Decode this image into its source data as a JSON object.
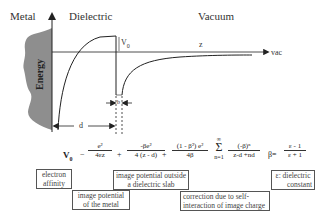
{
  "regions": {
    "metal": "Metal",
    "dielectric": "Dielectric",
    "vacuum": "Vacuum"
  },
  "axis": {
    "energy_label": "Energy",
    "z_label": "z",
    "vac_label": "vac",
    "v0_label": "V",
    "v0_sub": "0",
    "d_label": "d",
    "b_label": "b"
  },
  "formula": {
    "v0": "V",
    "v0_sub": "0",
    "minus": "−",
    "plus1": "+",
    "plus2": "+",
    "term1_num": "e²",
    "term1_den": "4εz",
    "term2_num": "-βe²",
    "term2_den": "4 (z - d)",
    "term3_num": "(1 - β²) e²",
    "term3_den": "4β",
    "sum_top": "∞",
    "sum_symbol": "Σ",
    "sum_bottom": "n=1",
    "term4_num": "(-β)ⁿ",
    "term4_den": "z-d +nd",
    "beta_lhs": "β=",
    "beta_num": "ε - 1",
    "beta_den": "ε + 1"
  },
  "annotations": {
    "electron_affinity": [
      "electron",
      "affinity"
    ],
    "image_metal": [
      "image potential",
      "of the metal"
    ],
    "image_slab": [
      "image potential outside",
      "a dielectric slab"
    ],
    "correction": [
      "correction due to self-",
      "interaction of image charge"
    ],
    "dielectric_const": [
      "ε: dielectric",
      "constant"
    ]
  },
  "colors": {
    "metal_fill": "#8e8e8e",
    "line": "#222222",
    "box_border": "#555555"
  }
}
